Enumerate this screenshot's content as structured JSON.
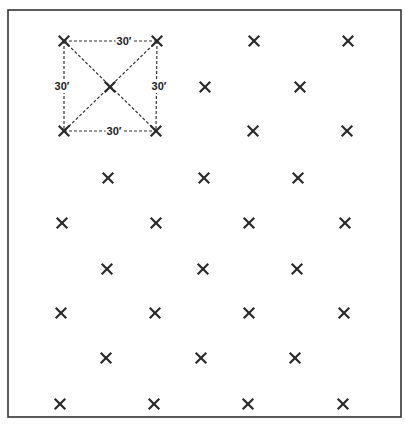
{
  "diagram": {
    "type": "quincunx-planting-layout",
    "border": {
      "left": 8,
      "top": 10,
      "right": 401,
      "bottom": 417,
      "color": "#333333"
    },
    "marker_symbol": "x-mark",
    "marker_color": "#2a2a2a",
    "spacing_label": "30′",
    "rows": [
      {
        "y": 41,
        "xs": [
          64,
          157,
          254,
          348
        ]
      },
      {
        "y": 87,
        "xs": [
          110,
          205,
          300
        ]
      },
      {
        "y": 131,
        "xs": [
          64,
          156,
          253,
          347
        ]
      },
      {
        "y": 178,
        "xs": [
          108,
          204,
          298
        ]
      },
      {
        "y": 223,
        "xs": [
          62,
          156,
          249,
          345
        ]
      },
      {
        "y": 269,
        "xs": [
          107,
          203,
          297
        ]
      },
      {
        "y": 313,
        "xs": [
          61,
          155,
          249,
          344
        ]
      },
      {
        "y": 358,
        "xs": [
          106,
          201,
          295
        ]
      },
      {
        "y": 404,
        "xs": [
          60,
          154,
          248,
          343
        ]
      }
    ],
    "highlight_square": {
      "corners": {
        "tl": [
          64,
          41
        ],
        "tr": [
          157,
          41
        ],
        "bl": [
          64,
          131
        ],
        "br": [
          156,
          131
        ]
      },
      "center": [
        110,
        87
      ],
      "line_style": "dashed",
      "labels": [
        {
          "id": "top",
          "text": "30′",
          "x": 124,
          "y": 41
        },
        {
          "id": "left",
          "text": "30′",
          "x": 62,
          "y": 86
        },
        {
          "id": "right",
          "text": "30′",
          "x": 159,
          "y": 86
        },
        {
          "id": "bottom",
          "text": "30′",
          "x": 114,
          "y": 131
        }
      ]
    }
  }
}
